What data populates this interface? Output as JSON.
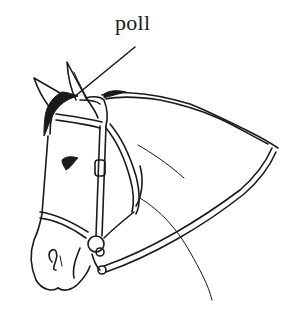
{
  "diagram": {
    "labels": [
      {
        "text": "poll",
        "target": "poll (top of head between ears)"
      }
    ],
    "colors": {
      "ink": "#1a1a1a",
      "background": "#ffffff"
    }
  }
}
